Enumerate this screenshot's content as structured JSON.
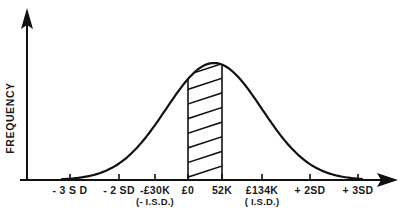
{
  "chart_data": {
    "type": "line",
    "title": "",
    "subtitle": "",
    "xlabel": "",
    "ylabel": "FREQUENCY",
    "grid": false,
    "legend": null,
    "curve_description": "normal distribution bell curve",
    "axis_x_ticks": [
      {
        "label": "- 3 S D",
        "sublabel": "",
        "sd": -3,
        "x_px": 70
      },
      {
        "label": "- 2 SD",
        "sublabel": "",
        "sd": -2,
        "x_px": 119
      },
      {
        "label": "-£30K",
        "sublabel": "(- I.S.D.)",
        "sd": -1,
        "x_px": 155
      },
      {
        "label": "£0",
        "sublabel": "",
        "sd": -0.35,
        "x_px": 188
      },
      {
        "label": "52K",
        "sublabel": "",
        "sd": 0.3,
        "x_px": 222
      },
      {
        "label": "£134K",
        "sublabel": "( I.S.D.)",
        "sd": 1,
        "x_px": 262
      },
      {
        "label": "+ 2SD",
        "sublabel": "",
        "sd": 2,
        "x_px": 310
      },
      {
        "label": "+ 3SD",
        "sublabel": "",
        "sd": 3,
        "x_px": 358
      }
    ],
    "shaded_region": {
      "name": "hatched-band",
      "from_label": "£0",
      "to_label": "52K",
      "x_start_px": 188,
      "x_end_px": 222,
      "fill_style": "diagonal-hatch",
      "hatch_line_count": 8
    },
    "axis_style": {
      "x_axis_arrow": true,
      "y_axis_arrow": true,
      "ink_color": "#111111"
    }
  },
  "figure": {
    "y_axis_title": "FREQUENCY"
  }
}
